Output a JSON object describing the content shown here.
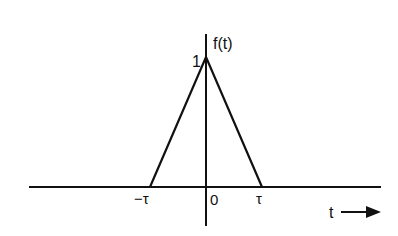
{
  "diagram": {
    "type": "triangular-pulse",
    "function_label": "f(t)",
    "peak_label": "1",
    "origin_label": "0",
    "left_tick_label": "−τ",
    "right_tick_label": "τ",
    "x_axis_label": "t",
    "stroke_color": "#111111",
    "background_color": "#ffffff"
  }
}
